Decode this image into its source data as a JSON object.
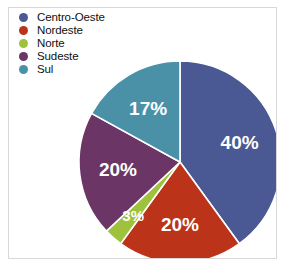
{
  "top_clip_text": "",
  "legend": {
    "items": [
      {
        "label": "Centro-Oeste",
        "color": "#4a5894"
      },
      {
        "label": "Nordeste",
        "color": "#bb3318"
      },
      {
        "label": "Norte",
        "color": "#9ec23c"
      },
      {
        "label": "Sudeste",
        "color": "#6b3566"
      },
      {
        "label": "Sul",
        "color": "#4a91a8"
      }
    ]
  },
  "chart_data": {
    "type": "pie",
    "title": "",
    "xlabel": "",
    "ylabel": "",
    "legend_position": "top-left",
    "start_angle_deg": 0,
    "direction": "clockwise",
    "categories": [
      "Centro-Oeste",
      "Nordeste",
      "Norte",
      "Sudeste",
      "Sul"
    ],
    "values": [
      40,
      20,
      3,
      20,
      17
    ],
    "labels": [
      "40%",
      "20%",
      "3%",
      "20%",
      "17%"
    ],
    "colors": [
      "#4a5894",
      "#bb3318",
      "#9ec23c",
      "#6b3566",
      "#4a91a8"
    ],
    "label_color": "#ffffff",
    "units": "percent",
    "total": 100
  },
  "geometry": {
    "center_x": 171,
    "center_y": 154,
    "radius": 101
  }
}
